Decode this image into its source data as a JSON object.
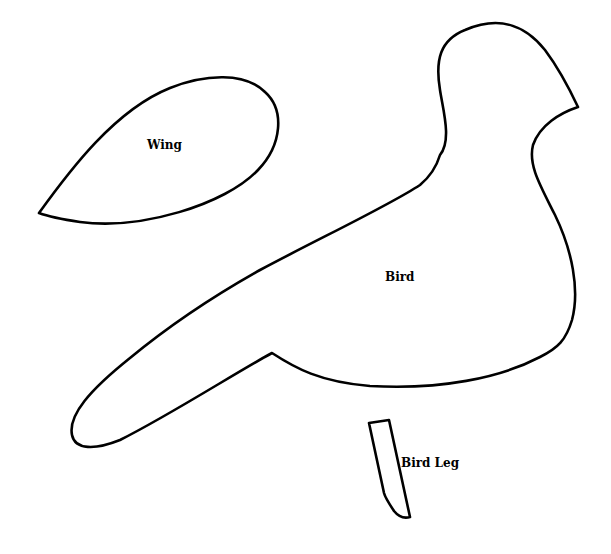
{
  "diagram": {
    "type": "craft-template",
    "background_color": "#ffffff",
    "outline_color": "#000000",
    "shapes": [
      {
        "id": "wing",
        "label": "Wing"
      },
      {
        "id": "bird",
        "label": "Bird"
      },
      {
        "id": "bird-leg",
        "label": "Bird Leg"
      }
    ]
  }
}
